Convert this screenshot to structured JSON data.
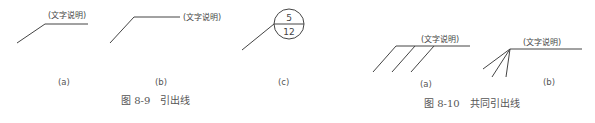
{
  "figures": [
    {
      "caption": "图 8-9　引出线",
      "panels": [
        {
          "label": "(a)",
          "annotation": "(文字说明)"
        },
        {
          "label": "(b)",
          "annotation": "(文字说明)"
        },
        {
          "label": "(c)",
          "numerator": "5",
          "denominator": "12"
        }
      ]
    },
    {
      "caption": "图 8-10　共同引出线",
      "panels": [
        {
          "label": "(a)",
          "annotation": "(文字说明)"
        },
        {
          "label": "(b)",
          "annotation": "(文字说明)"
        }
      ]
    }
  ],
  "colors": {
    "line": "#444444",
    "text": "#555555",
    "background": "#ffffff"
  }
}
